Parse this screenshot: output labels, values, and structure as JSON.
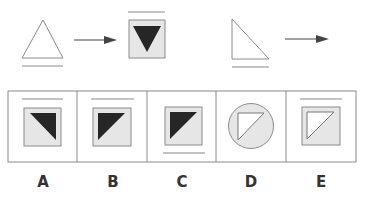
{
  "colors": {
    "stroke": "#8a8a8a",
    "dark_fill": "#262626",
    "light_fill": "#e6e6e6",
    "white": "#ffffff",
    "label": "#333333"
  },
  "question": {
    "sequence": [
      {
        "id": "stem-1",
        "shape": "isosceles-triangle-outline",
        "line": "below"
      },
      {
        "id": "result-1",
        "shape": "inverted-black-triangle-in-grey-square",
        "line": "above"
      },
      {
        "id": "stem-2",
        "shape": "right-triangle-outline",
        "line": "below"
      },
      {
        "id": "result-2",
        "shape": "unknown"
      }
    ]
  },
  "options": [
    {
      "label": "A",
      "shape": "black-triangle-top-right-in-grey-square",
      "line": "above"
    },
    {
      "label": "B",
      "shape": "black-triangle-top-left-in-grey-square",
      "line": "above"
    },
    {
      "label": "C",
      "shape": "black-triangle-top-left-in-grey-square",
      "line": "below"
    },
    {
      "label": "D",
      "shape": "white-triangle-top-left-in-grey-circle",
      "line": "none"
    },
    {
      "label": "E",
      "shape": "white-triangle-top-left-in-grey-square",
      "line": "above"
    }
  ]
}
